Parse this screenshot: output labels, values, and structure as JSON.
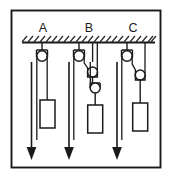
{
  "figure": {
    "background_color": "#ffffff",
    "ink_color": "#1a1a1a",
    "frame": {
      "x": 11,
      "y": 10,
      "width": 150,
      "height": 158
    },
    "ceiling": {
      "label": "hatched-support-ceiling",
      "y": 42,
      "x_start": 22,
      "x_end": 155,
      "hatch_count": 23,
      "hatch_direction": "up-right"
    },
    "systems": [
      {
        "id": "A",
        "label": "A",
        "label_x": 43,
        "label_y": 31,
        "pulley_count": 1,
        "description": "single fixed pulley",
        "mechanical_advantage": "1",
        "fixed_pulleys": [
          {
            "cx": 42,
            "cy": 56,
            "r": 5.2
          }
        ],
        "movable_pulleys": [],
        "weight": {
          "x": 51,
          "y": 100,
          "width": 15,
          "height": 28
        },
        "effort_arrow": {
          "x": 31,
          "y_top": 61,
          "y_tip": 158
        }
      },
      {
        "id": "B",
        "label": "B",
        "label_x": 89,
        "label_y": 31,
        "pulley_count": 3,
        "description": "one fixed pulley and two movable pulleys",
        "mechanical_advantage": "4",
        "fixed_pulleys": [
          {
            "cx": 78,
            "cy": 56,
            "r": 5.2
          }
        ],
        "movable_pulleys": [
          {
            "cx": 92,
            "cy": 72,
            "r": 5.0
          },
          {
            "cx": 95,
            "cy": 88,
            "r": 5.0
          }
        ],
        "weight": {
          "x": 88,
          "y": 105,
          "width": 15,
          "height": 28
        },
        "effort_arrow": {
          "x": 70,
          "y_top": 61,
          "y_tip": 158
        }
      },
      {
        "id": "C",
        "label": "C",
        "label_x": 133,
        "label_y": 31,
        "pulley_count": 2,
        "description": "one fixed pulley and one movable pulley",
        "mechanical_advantage": "2",
        "fixed_pulleys": [
          {
            "cx": 126,
            "cy": 56,
            "r": 5.2
          }
        ],
        "movable_pulleys": [
          {
            "cx": 140,
            "cy": 75,
            "r": 5.0
          }
        ],
        "weight": {
          "x": 133,
          "y": 103,
          "width": 15,
          "height": 28
        },
        "effort_arrow": {
          "x": 119,
          "y_top": 61,
          "y_tip": 158
        }
      }
    ]
  }
}
